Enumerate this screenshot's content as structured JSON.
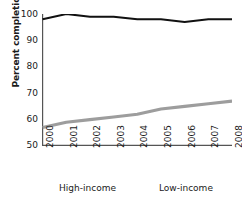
{
  "chart_data": {
    "type": "line",
    "title": "",
    "xlabel": "",
    "ylabel": "Percent completion",
    "x": [
      2000,
      2001,
      2002,
      2003,
      2004,
      2005,
      2006,
      2007,
      2008
    ],
    "categories": [
      "2000",
      "2001",
      "2002",
      "2003",
      "2004",
      "2005",
      "2006",
      "2007",
      "2008"
    ],
    "series": [
      {
        "name": "High-income",
        "color": "#111111",
        "values": [
          98,
          100,
          99,
          99,
          98,
          98,
          97,
          98,
          98
        ]
      },
      {
        "name": "Low-income",
        "color": "#9d9d9d",
        "values": [
          57,
          59,
          60,
          61,
          62,
          64,
          65,
          66,
          67
        ]
      }
    ],
    "ylim": [
      50,
      100
    ],
    "yticks": [
      50,
      60,
      70,
      80,
      90,
      100
    ],
    "ytick_labels": [
      "50",
      "60",
      "70",
      "80",
      "90",
      "100"
    ],
    "xlim": [
      2000,
      2008
    ],
    "grid": false,
    "legend_position": "bottom",
    "legend_entries": [
      "High-income",
      "Low-income"
    ]
  },
  "axes": {
    "y_title": "Percent completion",
    "y_ticks": [
      "100",
      "90",
      "80",
      "70",
      "60",
      "50"
    ],
    "x_ticks": [
      "2000",
      "2001",
      "2002",
      "2003",
      "2004",
      "2005",
      "2006",
      "2007",
      "2008"
    ]
  },
  "legend": {
    "items": [
      {
        "label": "High-income",
        "color": "#111111"
      },
      {
        "label": "Low-income",
        "color": "#9d9d9d"
      }
    ]
  },
  "colors": {
    "high_income": "#111111",
    "low_income": "#9d9d9d",
    "axis": "#555555",
    "background": "#ffffff"
  }
}
